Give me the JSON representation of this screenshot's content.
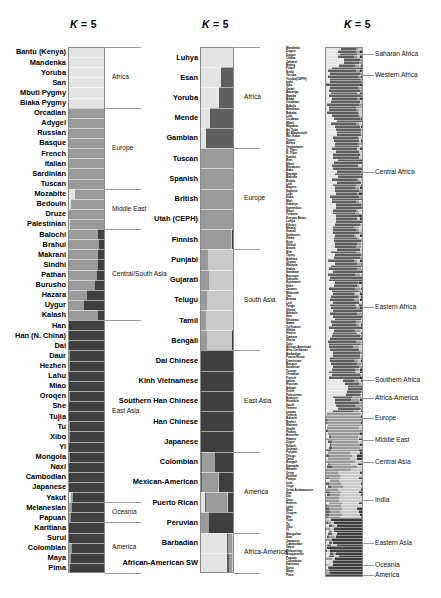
{
  "figure": {
    "type": "admixture-structure-plot",
    "colorspace": "grayscale",
    "panel_count": 3,
    "k_label_prefix": "K",
    "k_label_eq": "=",
    "k_value": "5"
  },
  "panels": [
    {
      "id": "panel-1",
      "name": "hgdp-panel",
      "title": "K = 5",
      "populations": [
        "Bantu (Kenya)",
        "Mandenka",
        "Yoruba",
        "San",
        "Mbuti Pygmy",
        "Biaka Pygmy",
        "Orcadian",
        "Adygei",
        "Russian",
        "Basque",
        "French",
        "Italian",
        "Sardinian",
        "Tuscan",
        "Mozabite",
        "Bedouin",
        "Druze",
        "Palestinian",
        "Balochi",
        "Brahui",
        "Makrani",
        "Sindhi",
        "Pathan",
        "Burusho",
        "Hazara",
        "Uygur",
        "Kalash",
        "Han",
        "Han (N. China)",
        "Dai",
        "Daur",
        "Hezhen",
        "Lahu",
        "Miao",
        "Oroqen",
        "She",
        "Tujia",
        "Tu",
        "Xibo",
        "Yi",
        "Mongola",
        "Naxi",
        "Cambodian",
        "Japanese",
        "Yakut",
        "Melanesian",
        "Papuan",
        "Karitiana",
        "Surui",
        "Colombian",
        "Maya",
        "Pima"
      ],
      "regions": [
        {
          "label": "Africa",
          "start": 0,
          "end": 6
        },
        {
          "label": "Europe",
          "start": 6,
          "end": 14
        },
        {
          "label": "Middle East",
          "start": 14,
          "end": 18
        },
        {
          "label": "Central/South Asia",
          "start": 18,
          "end": 27
        },
        {
          "label": "East Asia",
          "start": 27,
          "end": 45
        },
        {
          "label": "Oceania",
          "start": 45,
          "end": 47
        },
        {
          "label": "America",
          "start": 47,
          "end": 52
        }
      ]
    },
    {
      "id": "panel-2",
      "name": "1000-genomes-panel",
      "title": "K = 5",
      "populations": [
        "Luhya",
        "Esan",
        "Yoruba",
        "Mende",
        "Gambian",
        "Tuscan",
        "Spanish",
        "British",
        "Utah (CEPH)",
        "Finnish",
        "Punjabi",
        "Gujarati",
        "Telugu",
        "Tamil",
        "Bengali",
        "Dai Chinese",
        "Kinh Vietnamese",
        "Southern Han Chinese",
        "Han Chinese",
        "Japanese",
        "Colombian",
        "Mexican-American",
        "Puerto Rican",
        "Peruvian",
        "Barbadian",
        "African-American SW"
      ],
      "regions": [
        {
          "label": "Africa",
          "start": 0,
          "end": 5
        },
        {
          "label": "Europe",
          "start": 5,
          "end": 10
        },
        {
          "label": "South Asia",
          "start": 10,
          "end": 15
        },
        {
          "label": "East Asia",
          "start": 15,
          "end": 20
        },
        {
          "label": "America",
          "start": 20,
          "end": 24
        },
        {
          "label": "Africa-America",
          "start": 24,
          "end": 26
        }
      ]
    },
    {
      "id": "panel-3",
      "name": "global-panel",
      "title": "K = 5",
      "regions": [
        {
          "label": "Saharan Africa",
          "y": 54
        },
        {
          "label": "Western Africa",
          "y": 75
        },
        {
          "label": "Central Africa",
          "y": 172
        },
        {
          "label": "Eastern Africa",
          "y": 307
        },
        {
          "label": "Southern Africa",
          "y": 380
        },
        {
          "label": "Africa-America",
          "y": 398
        },
        {
          "label": "Europe",
          "y": 418
        },
        {
          "label": "Middle East",
          "y": 440
        },
        {
          "label": "Central Asia",
          "y": 462
        },
        {
          "label": "India",
          "y": 500
        },
        {
          "label": "Eastern Asia",
          "y": 543
        },
        {
          "label": "Oceania",
          "y": 565
        },
        {
          "label": "America",
          "y": 575
        }
      ],
      "micro_labels": [
        "Mandinka",
        "Dogon",
        "Dogon",
        "Chidra",
        "Jahanzi",
        "Bwing",
        "Fulani",
        "Nzebi",
        "Yoruba",
        "Yoruba(CEPH)",
        "Igala",
        "Igbo",
        "Gwari",
        "Basanga",
        "Bamba",
        "Biaka",
        "Ouidema",
        "Bakola",
        "Mandiara",
        "Bakaka",
        "Lubi",
        "Ouidawo",
        "Mbuti",
        "Nkgabra",
        "Ari Tube",
        "Ari Blacksmith",
        "Wo. Kaba",
        "Tupuri",
        "Bielsa",
        "Yembatama",
        "S. Tiber",
        "N. Tiber",
        "Kambu",
        "Bezi",
        "Mbuti",
        "Bitsaborn",
        "Baka",
        "Bandga",
        "Bakuda",
        "Bulala",
        "Lobi",
        "Bageru",
        "Sapienti",
        "Lobi",
        "Kaba",
        "Mori",
        "Kabaiyo",
        "Kanembou",
        "Mbuti",
        "Turkana",
        "Kenyan Bantu",
        "Luhya",
        "Kikuyu",
        "Maasai",
        "Somali",
        "Sudanese",
        "Dinka",
        "Nuer",
        "Shilluk",
        "Anuak",
        "Afar",
        "Tigray",
        "Amhara",
        "Oromo",
        "Wolayta",
        "Hadza",
        "Sandawe",
        "Burunge",
        "Sukuma",
        "Nyamwezi",
        "Hehe",
        "Zaramo",
        "Makonde",
        "Yao",
        "Bemba",
        "Lozi",
        "Tonga",
        "Shona",
        "Ndebele",
        "San",
        "Khomani",
        "Nama",
        "Ju|'hoansi",
        "Himba",
        "Herero",
        "Damara",
        "Xhosa",
        "Zulu",
        "African-American",
        "Afro-Caribbean",
        "Barbadian",
        "Puerto Rican",
        "Dominican",
        "Basque",
        "Sardinian",
        "Tuscan",
        "Orcadian",
        "French",
        "Italian",
        "Russian",
        "Adygei",
        "Druze",
        "Palestinian",
        "Bedouin",
        "Mozabite",
        "Saudi",
        "Yemeni",
        "Iranian",
        "Turkish",
        "Balochi",
        "Brahui",
        "Makrani",
        "Sindhi",
        "Pathan",
        "Burusho",
        "Hazara",
        "Uygur",
        "Kalash",
        "Gujarati",
        "Punjabi",
        "Telugu",
        "Tamil",
        "Bengali",
        "Kannada",
        "Marathi",
        "Oriya",
        "Santhal",
        "Paniya",
        "Irula",
        "Onge",
        "Great Andamanese",
        "Han",
        "Dai",
        "Daur",
        "Hezhen",
        "Lahu",
        "Miao",
        "Oroqen",
        "She",
        "Tujia",
        "Tu",
        "Xibo",
        "Yi",
        "Mongolian",
        "Naxi",
        "Japanese",
        "Cambodian",
        "Yakut",
        "Melanesian",
        "Bougainville",
        "Papuan",
        "Colombian",
        "Karitiana",
        "Surui",
        "Maya",
        "Pima"
      ]
    }
  ],
  "colors": {
    "africa_light": "#e4e4e4",
    "africa_dark": "#5e5e5e",
    "europe_mid": "#9a9a9a",
    "asia_dark": "#3e3e3e",
    "south_asia": "#c9c9c9",
    "america_dark": "#2f2f2f",
    "frame": "#8a8a8a",
    "background": "#ffffff",
    "text": "#000000",
    "leader_line": "#9a9a9a"
  },
  "chart_data": {
    "type": "bar",
    "title": "K = 5",
    "xlabel": "",
    "ylabel": "",
    "ylim": [
      0,
      1
    ],
    "grid": false,
    "legend_position": "right",
    "note": "Stacked horizontal ancestry proportions; each row is a population, bar width = 1.0 split among 5 grayscale ancestry components",
    "components": [
      "K1-light",
      "K2-dark-african",
      "K3-european-mid",
      "K4-south-asian",
      "K5-east-asian-dark"
    ],
    "panel_1": {
      "categories": [
        "Bantu (Kenya)",
        "Mandenka",
        "Yoruba",
        "San",
        "Mbuti Pygmy",
        "Biaka Pygmy",
        "Orcadian",
        "Adygei",
        "Russian",
        "Basque",
        "French",
        "Italian",
        "Sardinian",
        "Tuscan",
        "Mozabite",
        "Bedouin",
        "Druze",
        "Palestinian",
        "Balochi",
        "Brahui",
        "Makrani",
        "Sindhi",
        "Pathan",
        "Burusho",
        "Hazara",
        "Uygur",
        "Kalash",
        "Han",
        "Han (N. China)",
        "Dai",
        "Daur",
        "Hezhen",
        "Lahu",
        "Miao",
        "Oroqen",
        "She",
        "Tujia",
        "Tu",
        "Xibo",
        "Yi",
        "Mongola",
        "Naxi",
        "Cambodian",
        "Japanese",
        "Yakut",
        "Melanesian",
        "Papuan",
        "Karitiana",
        "Surui",
        "Colombian",
        "Maya",
        "Pima"
      ],
      "series": [
        {
          "name": "K1-light",
          "values": [
            0.97,
            0.98,
            0.98,
            0.96,
            0.97,
            0.98,
            0.02,
            0.02,
            0.01,
            0.01,
            0.01,
            0.02,
            0.01,
            0.02,
            0.18,
            0.08,
            0.03,
            0.05,
            0.02,
            0.02,
            0.04,
            0.02,
            0.02,
            0.02,
            0.02,
            0.02,
            0.02,
            0.02,
            0.02,
            0.02,
            0.02,
            0.02,
            0.02,
            0.02,
            0.02,
            0.02,
            0.02,
            0.02,
            0.02,
            0.02,
            0.02,
            0.02,
            0.02,
            0.02,
            0.08,
            0.02,
            0.02,
            0.01,
            0.01,
            0.03,
            0.02,
            0.02
          ]
        },
        {
          "name": "K3-european-mid",
          "values": [
            0.02,
            0.01,
            0.01,
            0.02,
            0.02,
            0.01,
            0.96,
            0.96,
            0.97,
            0.97,
            0.97,
            0.96,
            0.97,
            0.96,
            0.8,
            0.9,
            0.95,
            0.93,
            0.8,
            0.82,
            0.78,
            0.8,
            0.76,
            0.72,
            0.48,
            0.4,
            0.8,
            0.02,
            0.02,
            0.02,
            0.03,
            0.03,
            0.02,
            0.02,
            0.03,
            0.02,
            0.02,
            0.03,
            0.03,
            0.02,
            0.04,
            0.02,
            0.02,
            0.02,
            0.06,
            0.1,
            0.06,
            0.01,
            0.01,
            0.08,
            0.05,
            0.03
          ]
        },
        {
          "name": "K5-east-asian-dark",
          "values": [
            0.01,
            0.01,
            0.01,
            0.02,
            0.01,
            0.01,
            0.02,
            0.02,
            0.02,
            0.02,
            0.02,
            0.02,
            0.02,
            0.02,
            0.02,
            0.02,
            0.02,
            0.02,
            0.18,
            0.16,
            0.18,
            0.18,
            0.22,
            0.26,
            0.5,
            0.58,
            0.18,
            0.96,
            0.96,
            0.96,
            0.95,
            0.95,
            0.96,
            0.96,
            0.95,
            0.96,
            0.96,
            0.95,
            0.95,
            0.96,
            0.94,
            0.96,
            0.96,
            0.96,
            0.86,
            0.88,
            0.92,
            0.98,
            0.98,
            0.89,
            0.93,
            0.95
          ]
        }
      ]
    },
    "panel_2": {
      "categories": [
        "Luhya",
        "Esan",
        "Yoruba",
        "Mende",
        "Gambian",
        "Tuscan",
        "Spanish",
        "British",
        "Utah (CEPH)",
        "Finnish",
        "Punjabi",
        "Gujarati",
        "Telugu",
        "Tamil",
        "Bengali",
        "Dai Chinese",
        "Kinh Vietnamese",
        "Southern Han Chinese",
        "Han Chinese",
        "Japanese",
        "Colombian",
        "Mexican-American",
        "Puerto Rican",
        "Peruvian",
        "Barbadian",
        "African-American SW"
      ],
      "series": [
        {
          "name": "K1-light",
          "values": [
            0.97,
            0.62,
            0.55,
            0.28,
            0.18,
            0.01,
            0.01,
            0.01,
            0.01,
            0.01,
            0.02,
            0.02,
            0.02,
            0.02,
            0.02,
            0.01,
            0.01,
            0.01,
            0.01,
            0.01,
            0.03,
            0.03,
            0.14,
            0.02,
            0.78,
            0.8
          ]
        },
        {
          "name": "K2-dark-african",
          "values": [
            0.01,
            0.36,
            0.43,
            0.7,
            0.8,
            0.01,
            0.01,
            0.01,
            0.01,
            0.01,
            0.01,
            0.01,
            0.01,
            0.01,
            0.01,
            0.01,
            0.01,
            0.01,
            0.01,
            0.01,
            0.02,
            0.02,
            0.04,
            0.01,
            0.04,
            0.05
          ]
        },
        {
          "name": "K3-european-mid",
          "values": [
            0.01,
            0.01,
            0.01,
            0.01,
            0.01,
            0.97,
            0.97,
            0.97,
            0.97,
            0.9,
            0.2,
            0.22,
            0.18,
            0.16,
            0.18,
            0.01,
            0.01,
            0.01,
            0.01,
            0.01,
            0.38,
            0.48,
            0.62,
            0.22,
            0.12,
            0.1
          ]
        },
        {
          "name": "K4-south-asian",
          "values": [
            0.01,
            0.01,
            0.01,
            0.01,
            0.01,
            0.01,
            0.01,
            0.01,
            0.01,
            0.02,
            0.74,
            0.72,
            0.76,
            0.78,
            0.74,
            0.01,
            0.01,
            0.01,
            0.01,
            0.01,
            0.02,
            0.02,
            0.02,
            0.02,
            0.02,
            0.02
          ]
        },
        {
          "name": "K5-east-asian-dark",
          "values": [
            0.0,
            0.0,
            0.0,
            0.0,
            0.0,
            0.0,
            0.0,
            0.0,
            0.0,
            0.06,
            0.03,
            0.03,
            0.03,
            0.03,
            0.05,
            0.96,
            0.96,
            0.96,
            0.96,
            0.96,
            0.55,
            0.45,
            0.18,
            0.73,
            0.04,
            0.03
          ]
        }
      ]
    },
    "panel_3": {
      "note": "~190 fine-grained populations, one thin row each; grayscale stacked proportions",
      "regions": [
        "Saharan Africa",
        "Western Africa",
        "Central Africa",
        "Eastern Africa",
        "Southern Africa",
        "Africa-America",
        "Europe",
        "Middle East",
        "Central Asia",
        "India",
        "Eastern Asia",
        "Oceania",
        "America"
      ]
    }
  }
}
